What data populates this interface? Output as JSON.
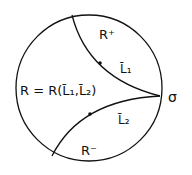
{
  "diagram": {
    "region_main_label": "R = R(L̄₁,L̄₂)",
    "region_upper_label": "R⁺",
    "region_lower_label": "R⁻",
    "curve_upper_label": "L̄₁",
    "curve_lower_label": "L̄₂",
    "point_label": "σ",
    "colors": {
      "stroke": "#111111",
      "background": "#ffffff"
    }
  }
}
